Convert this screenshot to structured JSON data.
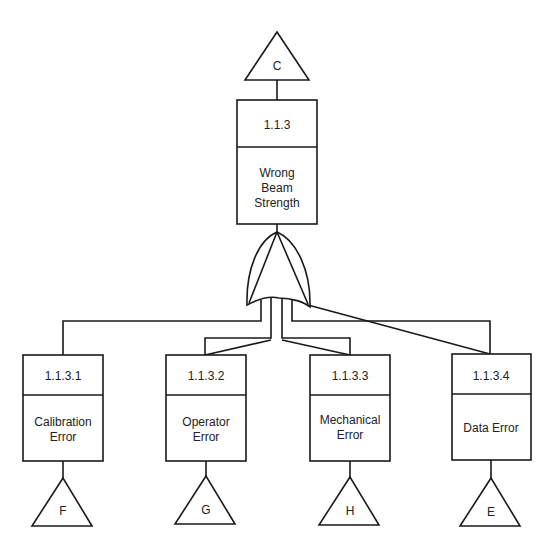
{
  "diagram": {
    "type": "fault-tree",
    "top_transfer": {
      "label": "C"
    },
    "top_event": {
      "id": "1.1.3",
      "lines": [
        "Wrong",
        "Beam",
        "Strength"
      ]
    },
    "gate": {
      "type": "OR"
    },
    "children": [
      {
        "id": "1.1.3.1",
        "lines": [
          "Calibration",
          "Error"
        ],
        "transfer": "F"
      },
      {
        "id": "1.1.3.2",
        "lines": [
          "Operator",
          "Error"
        ],
        "transfer": "G"
      },
      {
        "id": "1.1.3.3",
        "lines": [
          "Mechanical",
          "Error"
        ],
        "transfer": "H"
      },
      {
        "id": "1.1.3.4",
        "lines": [
          "Data Error"
        ],
        "transfer": "E"
      }
    ]
  }
}
